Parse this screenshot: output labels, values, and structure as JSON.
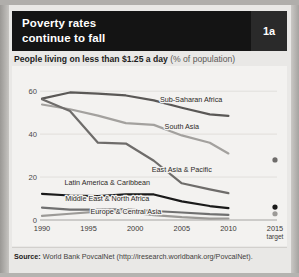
{
  "card": {
    "badge_label": "1a",
    "title": "Poverty rates\ncontinue to fall",
    "subtitle_main": "People living on less than $1.25 a day",
    "subtitle_note": "(% of population)",
    "source_label": "Source:",
    "source_text": "World Bank PovcalNet (http://iresearch.worldbank.org/PovcalNet)."
  },
  "colors": {
    "header_bg": "#141414",
    "badge_bg": "#2a2a2a",
    "panel_bg": "#f3f2f0",
    "grid": "#dcdad7",
    "sub_saharan": "#5a5856",
    "south_asia": "#a3a19e",
    "east_asia": "#6e6c6a",
    "latin_america": "#1a1a1a",
    "middle_east": "#707070",
    "europe_central": "#9c9a97"
  },
  "chart_data": {
    "type": "line",
    "title": "Poverty rates continue to fall",
    "subtitle": "People living on less than $1.25 a day (% of population)",
    "xlabel": "",
    "ylabel": "% of population",
    "x": [
      1990,
      1993,
      1996,
      1999,
      2002,
      2005,
      2008,
      2010
    ],
    "xtick_labels": [
      "1990",
      "1995",
      "2000",
      "2005",
      "2010",
      "2015"
    ],
    "xtick_sublabel": "target",
    "ytick_labels": [
      "0",
      "20",
      "40",
      "60"
    ],
    "ylim": [
      0,
      68
    ],
    "xlim": [
      1990,
      2015
    ],
    "grid": true,
    "legend": "inline-labels",
    "series": [
      {
        "name": "Sub-Saharan Africa",
        "color": "#5a5856",
        "x": [
          1990,
          1993,
          1996,
          1999,
          2002,
          2005,
          2008,
          2010
        ],
        "values": [
          56.5,
          59.4,
          58.9,
          58.0,
          55.7,
          52.3,
          49.2,
          48.5
        ],
        "label_x": 2006,
        "label_y": 55.0
      },
      {
        "name": "South Asia",
        "color": "#a3a19e",
        "x": [
          1990,
          1993,
          1996,
          1999,
          2002,
          2005,
          2008,
          2010
        ],
        "values": [
          53.8,
          51.6,
          48.6,
          45.1,
          44.3,
          39.4,
          36.0,
          31.0
        ],
        "label_x": 2005,
        "label_y": 42.5
      },
      {
        "name": "East Asia & Pacific",
        "color": "#6e6c6a",
        "x": [
          1990,
          1993,
          1996,
          1999,
          2002,
          2005,
          2008,
          2010
        ],
        "values": [
          56.2,
          50.8,
          36.0,
          35.6,
          27.6,
          17.1,
          14.3,
          12.5
        ],
        "label_x": 2005,
        "label_y": 22.5
      },
      {
        "name": "Latin America & Caribbean",
        "color": "#1a1a1a",
        "x": [
          1990,
          1993,
          1996,
          1999,
          2002,
          2005,
          2008,
          2010
        ],
        "values": [
          12.2,
          11.4,
          11.1,
          11.9,
          11.9,
          8.7,
          6.5,
          5.5
        ],
        "label_x": 1997,
        "label_y": 16.5
      },
      {
        "name": "Middle East & North Africa",
        "color": "#707070",
        "x": [
          1990,
          1993,
          1996,
          1999,
          2002,
          2005,
          2008,
          2010
        ],
        "values": [
          5.8,
          4.8,
          4.8,
          5.0,
          4.2,
          3.5,
          2.7,
          2.4
        ],
        "label_x": 1997,
        "label_y": 8.8
      },
      {
        "name": "Europe & Central Asia",
        "color": "#9c9a97",
        "x": [
          1990,
          1993,
          1996,
          1999,
          2002,
          2005,
          2008,
          2010
        ],
        "values": [
          1.9,
          2.9,
          3.9,
          3.8,
          2.3,
          1.3,
          0.6,
          0.7
        ],
        "label_x": 1999,
        "label_y": 2.6
      }
    ],
    "target_markers": [
      {
        "name": "East Asia & Pacific target",
        "color": "#6e6c6a",
        "value": 28.0
      },
      {
        "name": "Latin America & Caribbean target",
        "color": "#1a1a1a",
        "value": 6.0
      },
      {
        "name": "Middle East & North Africa target",
        "color": "#9c9a97",
        "value": 2.9
      }
    ]
  }
}
